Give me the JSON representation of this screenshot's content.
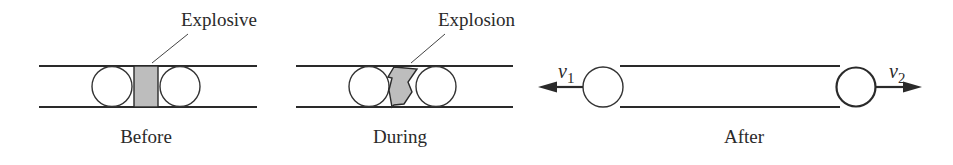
{
  "figure": {
    "panels": [
      {
        "id": "before",
        "caption": "Before",
        "callout": "Explosive"
      },
      {
        "id": "during",
        "caption": "During",
        "callout": "Explosion"
      },
      {
        "id": "after",
        "caption": "After",
        "velocity_left": {
          "symbol": "v",
          "subscript": "1",
          "direction": "left"
        },
        "velocity_right": {
          "symbol": "v",
          "subscript": "2",
          "direction": "right"
        }
      }
    ],
    "colors": {
      "line": "#2a2a2a",
      "explosive_fill": "#bdbdbd",
      "background": "#ffffff"
    }
  }
}
